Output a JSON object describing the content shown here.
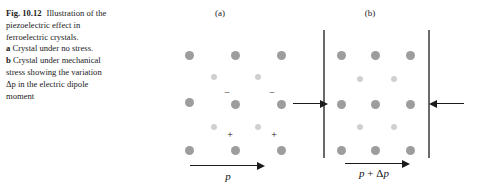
{
  "figure": {
    "caption": {
      "label": "Fig. 10.12",
      "lines": [
        "Illustration of the",
        "piezoelectric effect in",
        "ferroelectric crystals."
      ],
      "item_a_marker": "a",
      "item_a_text": "Crystal under no stress.",
      "item_b_marker": "b",
      "item_b_lines": [
        "Crystal under mechanical",
        "stress showing the variation",
        "Δp in the electric dipole",
        "moment"
      ]
    },
    "panel_a": {
      "label": "(a)",
      "polarization_label": "p",
      "negative_sign": "−",
      "positive_sign": "+",
      "negative_sign_count": 2,
      "positive_sign_count": 2,
      "lattice": {
        "dark_dot_color": "#9d9d9d",
        "light_dot_color": "#d0d0d0",
        "dark_rows": 3,
        "dark_cols": 3,
        "light_rows": 2,
        "light_cols": 2,
        "dark_dots": [
          {
            "x": 185,
            "y": 51
          },
          {
            "x": 231,
            "y": 51
          },
          {
            "x": 277,
            "y": 51
          },
          {
            "x": 185,
            "y": 98
          },
          {
            "x": 231,
            "y": 100
          },
          {
            "x": 277,
            "y": 100
          },
          {
            "x": 185,
            "y": 146
          },
          {
            "x": 231,
            "y": 146
          },
          {
            "x": 277,
            "y": 146
          }
        ],
        "light_dots": [
          {
            "x": 211,
            "y": 74
          },
          {
            "x": 255,
            "y": 74
          },
          {
            "x": 211,
            "y": 124
          },
          {
            "x": 255,
            "y": 124
          }
        ],
        "minus_positions": [
          {
            "x": 222,
            "y": 88
          },
          {
            "x": 267,
            "y": 88
          }
        ],
        "plus_positions": [
          {
            "x": 225,
            "y": 130
          },
          {
            "x": 269,
            "y": 130
          }
        ]
      },
      "arrow": {
        "x": 190,
        "y": 165,
        "length": 68,
        "direction": "right"
      }
    },
    "panel_b": {
      "label": "(b)",
      "polarization_label_parts": {
        "p": "p",
        "plus": " + ",
        "delta": "Δ",
        "dp": "p"
      },
      "polarization_label": "p + Δp",
      "plates": [
        {
          "x": 323,
          "y": 30,
          "height": 128
        },
        {
          "x": 428,
          "y": 30,
          "height": 128
        }
      ],
      "stress_arrows": [
        {
          "x": 293,
          "y": 103,
          "length": 28,
          "direction": "right"
        },
        {
          "x": 436,
          "y": 103,
          "length": 28,
          "direction": "left"
        }
      ],
      "lattice": {
        "dark_dot_color": "#9d9d9d",
        "light_dot_color": "#d0d0d0",
        "dark_rows": 3,
        "dark_cols": 3,
        "light_rows": 2,
        "light_cols": 2,
        "dark_dots": [
          {
            "x": 337,
            "y": 51
          },
          {
            "x": 371,
            "y": 51
          },
          {
            "x": 406,
            "y": 51
          },
          {
            "x": 337,
            "y": 100
          },
          {
            "x": 371,
            "y": 100
          },
          {
            "x": 406,
            "y": 100
          },
          {
            "x": 337,
            "y": 146
          },
          {
            "x": 371,
            "y": 146
          },
          {
            "x": 406,
            "y": 146
          }
        ],
        "light_dots": [
          {
            "x": 357,
            "y": 76
          },
          {
            "x": 391,
            "y": 76
          },
          {
            "x": 357,
            "y": 124
          },
          {
            "x": 391,
            "y": 124
          }
        ]
      },
      "arrow": {
        "x": 345,
        "y": 163,
        "length": 58,
        "direction": "right"
      }
    }
  }
}
